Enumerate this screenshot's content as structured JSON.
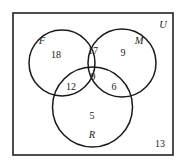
{
  "diagram": {
    "type": "venn-3-set",
    "universe_label": "U",
    "sets": [
      {
        "id": "F",
        "label": "F"
      },
      {
        "id": "M",
        "label": "M"
      },
      {
        "id": "R",
        "label": "R"
      }
    ],
    "regions": {
      "F_only": "18",
      "M_only": "9",
      "R_only": "5",
      "F_and_M_only": "17",
      "F_and_R_only": "12",
      "M_and_R_only": "6",
      "F_and_M_and_R": "9",
      "outside": "13"
    },
    "colors": {
      "stroke": "#1a1a1a",
      "background": "#ffffff",
      "text": "#222222"
    }
  }
}
